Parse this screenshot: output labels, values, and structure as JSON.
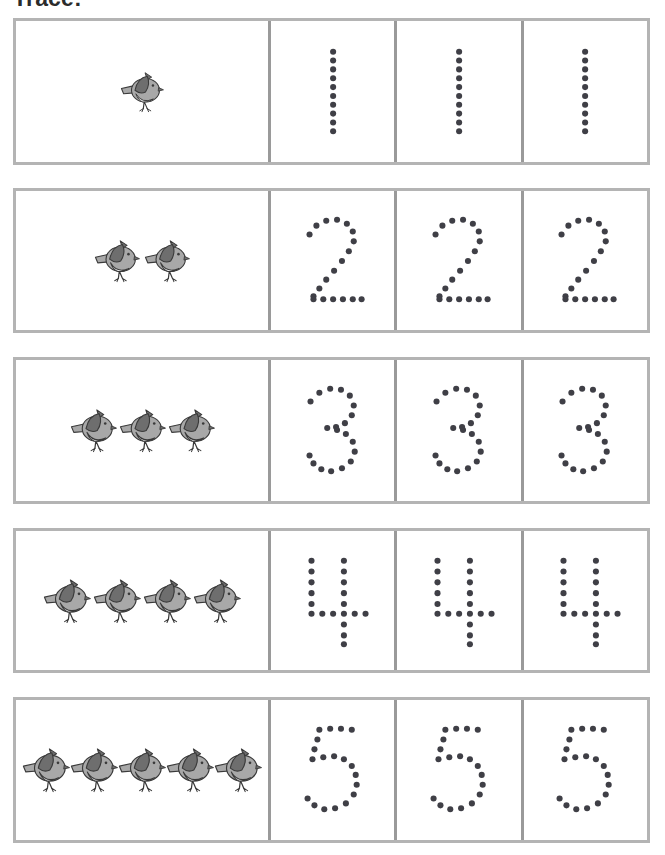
{
  "worksheet": {
    "title": "Trace:",
    "colors": {
      "row_border": "#b4b4b4",
      "cell_divider": "#9a9a9a",
      "trace_dot": "#3f3f46",
      "bird_body": "#a8a8a8",
      "bird_wing": "#6e6e6e",
      "bird_belly": "#f2f2f2",
      "bird_outline": "#3a3a3a",
      "page_background": "#ffffff"
    },
    "instruction_label": "Trace:",
    "rows": [
      {
        "number": 1,
        "numeral_label": "1",
        "bird_count": 1,
        "bird_icon": "bird-icon",
        "trace_cells": 3,
        "trace_cell_labels": [
          "trace-1-a",
          "trace-1-b",
          "trace-1-c"
        ],
        "dots": [
          [
            50,
            16
          ],
          [
            50,
            25
          ],
          [
            50,
            34
          ],
          [
            50,
            43
          ],
          [
            50,
            52
          ],
          [
            50,
            61
          ],
          [
            50,
            70
          ],
          [
            50,
            79
          ],
          [
            50,
            88
          ],
          [
            50,
            97
          ]
        ]
      },
      {
        "number": 2,
        "numeral_label": "2",
        "bird_count": 2,
        "bird_icon": "bird-icon",
        "trace_cells": 3,
        "trace_cell_labels": [
          "trace-2-a",
          "trace-2-b",
          "trace-2-c"
        ],
        "dots": [
          [
            26,
            30
          ],
          [
            33,
            21
          ],
          [
            43,
            16
          ],
          [
            54,
            15
          ],
          [
            64,
            19
          ],
          [
            70,
            27
          ],
          [
            71,
            37
          ],
          [
            66,
            47
          ],
          [
            59,
            57
          ],
          [
            51,
            67
          ],
          [
            43,
            76
          ],
          [
            36,
            85
          ],
          [
            30,
            93
          ],
          [
            30,
            96
          ],
          [
            40,
            96
          ],
          [
            50,
            96
          ],
          [
            60,
            96
          ],
          [
            70,
            96
          ],
          [
            79,
            96
          ]
        ]
      },
      {
        "number": 3,
        "numeral_label": "3",
        "bird_count": 3,
        "bird_icon": "bird-icon",
        "trace_cells": 3,
        "trace_cell_labels": [
          "trace-3-a",
          "trace-3-b",
          "trace-3-c"
        ],
        "dots": [
          [
            27,
            27
          ],
          [
            36,
            18
          ],
          [
            47,
            14
          ],
          [
            58,
            15
          ],
          [
            67,
            21
          ],
          [
            71,
            31
          ],
          [
            69,
            41
          ],
          [
            62,
            49
          ],
          [
            53,
            53
          ],
          [
            44,
            54
          ],
          [
            54,
            56
          ],
          [
            63,
            60
          ],
          [
            70,
            68
          ],
          [
            72,
            78
          ],
          [
            68,
            88
          ],
          [
            59,
            95
          ],
          [
            48,
            98
          ],
          [
            38,
            96
          ],
          [
            30,
            90
          ],
          [
            26,
            82
          ]
        ]
      },
      {
        "number": 4,
        "numeral_label": "4",
        "bird_count": 4,
        "bird_icon": "bird-icon",
        "trace_cells": 3,
        "trace_cell_labels": [
          "trace-4-a",
          "trace-4-b",
          "trace-4-c"
        ],
        "dots": [
          [
            28,
            16
          ],
          [
            28,
            27
          ],
          [
            28,
            38
          ],
          [
            28,
            49
          ],
          [
            28,
            60
          ],
          [
            28,
            70
          ],
          [
            39,
            70
          ],
          [
            50,
            70
          ],
          [
            61,
            70
          ],
          [
            72,
            70
          ],
          [
            83,
            70
          ],
          [
            61,
            16
          ],
          [
            61,
            27
          ],
          [
            61,
            38
          ],
          [
            61,
            49
          ],
          [
            61,
            60
          ],
          [
            61,
            81
          ],
          [
            61,
            92
          ],
          [
            61,
            101
          ]
        ]
      },
      {
        "number": 5,
        "numeral_label": "5",
        "bird_count": 5,
        "bird_icon": "bird-icon",
        "trace_cells": 3,
        "trace_cell_labels": [
          "trace-5-a",
          "trace-5-b",
          "trace-5-c"
        ],
        "dots": [
          [
            36,
            16
          ],
          [
            47,
            15
          ],
          [
            58,
            15
          ],
          [
            69,
            16
          ],
          [
            34,
            26
          ],
          [
            31,
            36
          ],
          [
            29,
            46
          ],
          [
            40,
            44
          ],
          [
            51,
            43
          ],
          [
            61,
            46
          ],
          [
            69,
            53
          ],
          [
            73,
            62
          ],
          [
            74,
            72
          ],
          [
            71,
            82
          ],
          [
            63,
            91
          ],
          [
            52,
            96
          ],
          [
            41,
            97
          ],
          [
            31,
            93
          ],
          [
            24,
            86
          ]
        ]
      }
    ]
  }
}
